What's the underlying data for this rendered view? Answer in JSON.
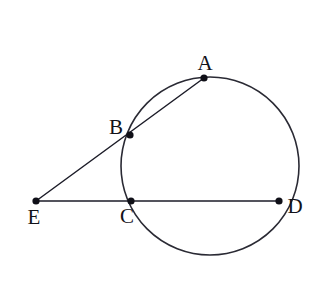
{
  "figure": {
    "background_color": "#ffffff",
    "stroke_color": "#1c1c28",
    "label_color": "#121219",
    "width": 324,
    "height": 289
  },
  "circle": {
    "name": "main-circle",
    "center_x": 210,
    "center_y": 166,
    "radius": 89
  },
  "points": [
    {
      "id": "A",
      "label": "A",
      "x": 204,
      "y": 78,
      "label_x": 205,
      "label_y": 70,
      "dot_radius": 3.6
    },
    {
      "id": "B",
      "label": "B",
      "x": 130,
      "y": 135,
      "label_x": 116,
      "label_y": 134,
      "dot_radius": 3.6
    },
    {
      "id": "C",
      "label": "C",
      "x": 131,
      "y": 201,
      "label_x": 127,
      "label_y": 223,
      "dot_radius": 3.6
    },
    {
      "id": "D",
      "label": "D",
      "x": 279,
      "y": 201,
      "label_x": 295,
      "label_y": 213,
      "dot_radius": 3.6
    },
    {
      "id": "E",
      "label": "E",
      "x": 36,
      "y": 201,
      "label_x": 34,
      "label_y": 224,
      "dot_radius": 3.6
    }
  ],
  "segments": [
    {
      "id": "EA",
      "name": "secant-e-a",
      "from": "E",
      "to": "A",
      "x1": 36,
      "y1": 201,
      "x2": 204,
      "y2": 78
    },
    {
      "id": "ED",
      "name": "secant-e-d",
      "from": "E",
      "to": "D",
      "x1": 36,
      "y1": 201,
      "x2": 279,
      "y2": 201
    }
  ],
  "labels": {
    "A": "A",
    "B": "B",
    "C": "C",
    "D": "D",
    "E": "E"
  }
}
